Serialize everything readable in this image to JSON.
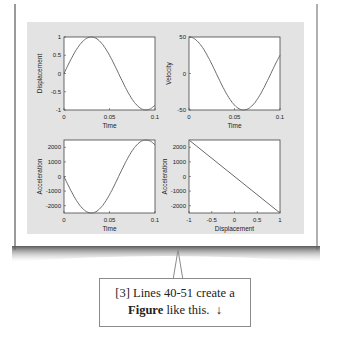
{
  "callout": {
    "line1": "[3] Lines 40-51 create a",
    "bold_word": "Figure",
    "line2_rest": " like this.",
    "arrow_glyph": "↓"
  },
  "colors": {
    "figure_bg": "#e3e3e3",
    "axes_bg": "#ffffff",
    "line": "#6a6a6a",
    "frame": "#444444"
  },
  "chart_data": [
    {
      "type": "line",
      "title": "",
      "xlabel": "Time",
      "ylabel": "Displacement",
      "xlim": [
        0,
        0.1
      ],
      "ylim": [
        -1,
        1
      ],
      "xticks": [
        "0",
        "0.05",
        "0.1"
      ],
      "yticks": [
        "-1",
        "-0.5",
        "0",
        "0.5",
        "1"
      ],
      "x": [
        0,
        0.01,
        0.02,
        0.03,
        0.04,
        0.05,
        0.06,
        0.07,
        0.08,
        0.09,
        0.1
      ],
      "values": [
        0,
        0.5,
        0.87,
        1.0,
        0.87,
        0.5,
        0.0,
        -0.5,
        -0.87,
        -1.0,
        -0.87
      ],
      "grid": false
    },
    {
      "type": "line",
      "title": "",
      "xlabel": "Time",
      "ylabel": "Velocity",
      "xlim": [
        0,
        0.1
      ],
      "ylim": [
        -50,
        50
      ],
      "xticks": [
        "0",
        "0.05",
        "0.1"
      ],
      "yticks": [
        "-50",
        "0",
        "50"
      ],
      "x": [
        0,
        0.01,
        0.02,
        0.03,
        0.04,
        0.05,
        0.06,
        0.07,
        0.08,
        0.09,
        0.1
      ],
      "values": [
        50,
        43,
        25,
        0,
        -25,
        -43,
        -50,
        -43,
        -25,
        0,
        13
      ],
      "grid": false
    },
    {
      "type": "line",
      "title": "",
      "xlabel": "Time",
      "ylabel": "Acceleration",
      "xlim": [
        0,
        0.1
      ],
      "ylim": [
        -2500,
        2500
      ],
      "xticks": [
        "0",
        "0.05",
        "0.1"
      ],
      "yticks": [
        "-2000",
        "-1000",
        "0",
        "1000",
        "2000"
      ],
      "x": [
        0,
        0.01,
        0.02,
        0.03,
        0.04,
        0.05,
        0.06,
        0.07,
        0.08,
        0.09,
        0.1
      ],
      "values": [
        0,
        -1250,
        -2165,
        -2500,
        -2165,
        -1250,
        0,
        1250,
        2165,
        2500,
        2165
      ],
      "grid": false
    },
    {
      "type": "line",
      "title": "",
      "xlabel": "Displacement",
      "ylabel": "Acceleration",
      "xlim": [
        -1,
        1
      ],
      "ylim": [
        -2500,
        2500
      ],
      "xticks": [
        "-1",
        "-0.5",
        "0",
        "0.5",
        "1"
      ],
      "yticks": [
        "-2000",
        "-1000",
        "0",
        "1000",
        "2000"
      ],
      "x": [
        -1,
        1
      ],
      "values": [
        2500,
        -2500
      ],
      "grid": false
    }
  ]
}
